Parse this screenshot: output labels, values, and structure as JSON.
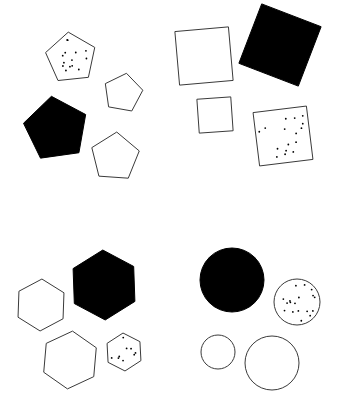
{
  "canvas": {
    "width": 338,
    "height": 403,
    "background_color": "#ffffff",
    "stroke_color": "#3a3a3a",
    "fill_black": "#000000",
    "dot_color": "#000000",
    "title": "Shape Grid Panel"
  },
  "quadrants": [
    {
      "name": "top-left",
      "shape_family": "pentagon",
      "count": 4
    },
    {
      "name": "top-right",
      "shape_family": "square",
      "count": 4
    },
    {
      "name": "bottom-left",
      "shape_family": "hexagon",
      "count": 4
    },
    {
      "name": "bottom-right",
      "shape_family": "circle",
      "count": 4
    }
  ],
  "shapes": [
    {
      "id": "pentagon-dotted",
      "family": "pentagon",
      "quadrant": "top-left",
      "fill": "dotted",
      "cx": 71,
      "cy": 58,
      "r": 26,
      "rotation": -6,
      "dots": 14
    },
    {
      "id": "pentagon-outline-small",
      "family": "pentagon",
      "quadrant": "top-left",
      "fill": "outline",
      "cx": 123,
      "cy": 93,
      "r": 20,
      "rotation": 10,
      "dots": 0
    },
    {
      "id": "pentagon-solid",
      "family": "pentagon",
      "quadrant": "top-left",
      "fill": "solid",
      "cx": 56,
      "cy": 129,
      "r": 33,
      "rotation": -8,
      "dots": 0
    },
    {
      "id": "pentagon-outline-large",
      "family": "pentagon",
      "quadrant": "top-left",
      "fill": "outline",
      "cx": 115,
      "cy": 157,
      "r": 25,
      "rotation": 4,
      "dots": 0
    },
    {
      "id": "square-outline-large",
      "family": "square",
      "quadrant": "top-right",
      "fill": "outline",
      "cx": 204,
      "cy": 56,
      "r": 38,
      "rotation": -5,
      "dots": 0
    },
    {
      "id": "square-solid",
      "family": "square",
      "quadrant": "top-right",
      "fill": "solid",
      "cx": 280,
      "cy": 45,
      "r": 45,
      "rotation": 21,
      "dots": 0
    },
    {
      "id": "square-outline-small",
      "family": "square",
      "quadrant": "top-right",
      "fill": "outline",
      "cx": 215,
      "cy": 115,
      "r": 24,
      "rotation": -4,
      "dots": 0
    },
    {
      "id": "square-dotted",
      "family": "square",
      "quadrant": "top-right",
      "fill": "dotted",
      "cx": 283,
      "cy": 136,
      "r": 38,
      "rotation": -7,
      "dots": 16
    },
    {
      "id": "hexagon-outline-left",
      "family": "hexagon",
      "quadrant": "bottom-left",
      "fill": "outline",
      "cx": 41,
      "cy": 305,
      "r": 26,
      "rotation": 2,
      "dots": 0
    },
    {
      "id": "hexagon-solid",
      "family": "hexagon",
      "quadrant": "bottom-left",
      "fill": "solid",
      "cx": 104,
      "cy": 285,
      "r": 35,
      "rotation": -2,
      "dots": 0
    },
    {
      "id": "hexagon-outline-bottom",
      "family": "hexagon",
      "quadrant": "bottom-left",
      "fill": "outline",
      "cx": 70,
      "cy": 360,
      "r": 29,
      "rotation": 5,
      "dots": 0
    },
    {
      "id": "hexagon-dotted",
      "family": "hexagon",
      "quadrant": "bottom-left",
      "fill": "dotted",
      "cx": 124,
      "cy": 352,
      "r": 19,
      "rotation": -3,
      "dots": 9
    },
    {
      "id": "circle-solid",
      "family": "circle",
      "quadrant": "bottom-right",
      "fill": "solid",
      "cx": 232,
      "cy": 280,
      "r": 32,
      "rotation": 0,
      "dots": 0
    },
    {
      "id": "circle-dotted",
      "family": "circle",
      "quadrant": "bottom-right",
      "fill": "dotted",
      "cx": 297,
      "cy": 302,
      "r": 23,
      "rotation": 0,
      "dots": 18
    },
    {
      "id": "circle-outline-small",
      "family": "circle",
      "quadrant": "bottom-right",
      "fill": "outline",
      "cx": 218,
      "cy": 352,
      "r": 17,
      "rotation": 0,
      "dots": 0
    },
    {
      "id": "circle-outline-large",
      "family": "circle",
      "quadrant": "bottom-right",
      "fill": "outline",
      "cx": 272,
      "cy": 363,
      "r": 27,
      "rotation": 0,
      "dots": 0
    }
  ]
}
